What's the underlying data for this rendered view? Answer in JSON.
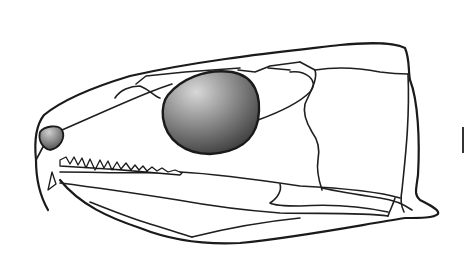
{
  "figure": {
    "title": "",
    "labels": [],
    "colors": {
      "line": "#1a1a1a",
      "background": "#ffffff",
      "orbit_light": "#d8d8d8",
      "orbit_dark": "#2a2a2a",
      "naris_light": "#cfcfcf",
      "naris_dark": "#3a3a3a"
    },
    "shapes": {
      "outline": "M48,210 C40,196 36,178 36,160 C34,140 36,125 44,115 C60,102 90,88 130,76 C200,60 280,52 340,45 C370,42 395,43 405,48 C410,60 408,70 410,80 C418,100 420,140 418,175 C416,190 414,195 420,200 C430,205 440,210 438,214 C434,218 420,218 405,218 C360,225 300,237 240,243 C200,245 165,238 140,228 C110,218 80,205 60,180",
      "orbit": "M168,95 C180,80 205,68 232,72 C255,76 262,96 258,120 C254,140 240,152 210,154 C185,154 166,140 163,118 C162,108 164,100 168,95 Z",
      "naris": "M40,132 C44,126 58,124 62,130 C66,138 60,148 50,150 C42,148 38,140 40,132 Z",
      "sutures": [
        "M44,145 L36,160",
        "M62,130 C90,118 120,104 150,92 C160,88 166,86 172,84",
        "M115,98 C120,90 130,86 140,86 C150,90 154,96 160,98",
        "M136,84 L146,76 L185,72 L240,68",
        "M238,70 L255,72 L270,66 L300,62",
        "M258,120 C280,112 300,102 310,92 C320,80 305,70 290,72",
        "M268,68 L290,70",
        "M300,62 L315,70 C318,80 310,92 305,104 C303,112 306,122 312,132 C318,140 320,150 318,160 C316,172 320,184 322,190",
        "M315,70 C340,66 360,68 380,72 C395,74 400,74 408,74",
        "M408,74 C410,120 405,160 402,190 C400,200 402,208 404,212",
        "M60,172 C100,172 140,174 180,172 C220,174 260,180 300,186 C340,188 380,192 400,198",
        "M322,188 C340,192 360,195 380,198 C395,200 405,205 412,210",
        "M395,198 C393,205 390,210 388,216",
        "M60,183 C100,188 140,194 178,200 C200,204 240,210 280,213 C320,214 360,212 388,216",
        "M280,184 C282,190 278,198 270,203 C275,206 290,206 300,206 C330,204 360,206 388,212",
        "M90,202 C110,210 130,218 150,224 C170,230 185,235 192,237",
        "M192,237 C220,230 260,222 300,218"
      ],
      "upper_teeth": "M60,160 L66,157 L70,164 L74,157 L78,165 L82,158 L86,168 L90,159 L95,170 L100,160 L104,168 L108,161 L112,170 L117,162 L121,169 L126,163 L131,170 L135,165 L139,170 L143,166 L147,171 L152,167 L157,171 L162,168 L168,172 L175,170 L182,173 L180,175 C150,172 100,168 60,166 Z",
      "lower_fang": "M52,172 L48,190 L56,184 Z"
    }
  }
}
